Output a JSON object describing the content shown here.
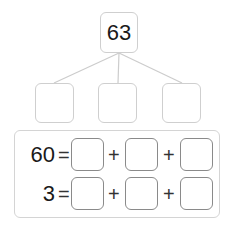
{
  "tree": {
    "root": "63",
    "children": [
      "",
      "",
      ""
    ]
  },
  "equations": [
    {
      "total": "60",
      "equals": "=",
      "operators": [
        "+",
        "+"
      ],
      "answers": [
        "",
        "",
        ""
      ]
    },
    {
      "total": "3",
      "equals": "=",
      "operators": [
        "+",
        "+"
      ],
      "answers": [
        "",
        "",
        ""
      ]
    }
  ],
  "colors": {
    "line": "#cccccc",
    "box_border": "#cfcfcf",
    "answer_border": "#8a8a8a"
  }
}
